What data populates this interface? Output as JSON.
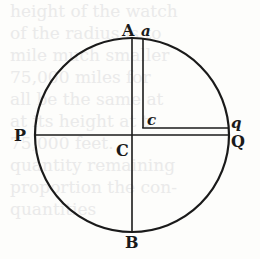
{
  "diagram": {
    "type": "circle-geometry-figure",
    "colors": {
      "stroke": "#1a1a1a",
      "background": "#fdfdfb",
      "bleed_text": "#eaeaea"
    },
    "circle": {
      "center_x": 132,
      "center_y": 135,
      "radius": 97
    },
    "lines": [
      {
        "name": "AB",
        "from": "A",
        "to": "B"
      },
      {
        "name": "PQ",
        "from": "P",
        "to": "Q"
      },
      {
        "name": "ac",
        "from": "a",
        "to": "c"
      },
      {
        "name": "cq",
        "from": "c",
        "to": "q"
      }
    ],
    "labels": {
      "A": "A",
      "a": "a",
      "P": "P",
      "C": "C",
      "c": "c",
      "q": "q",
      "Q": "Q",
      "B": "B"
    }
  },
  "bleed_through_text": [
    "height of the watch",
    "of the radius is to",
    "mile much smaller",
    "75,000 miles for",
    "all be the same at",
    "at its height at t",
    "75,000 feet.",
    "quantity remaining",
    "proportion the con-",
    "quantities"
  ]
}
